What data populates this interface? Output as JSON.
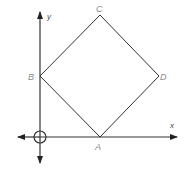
{
  "diagram": {
    "type": "coordinate-geometry",
    "axes": {
      "x_label": "x",
      "y_label": "y",
      "origin_marker": "circle-crosshair"
    },
    "shape": "square",
    "vertices": [
      {
        "name": "A",
        "label": "A",
        "position": "on x-axis"
      },
      {
        "name": "B",
        "label": "B",
        "position": "on y-axis"
      },
      {
        "name": "C",
        "label": "C",
        "position": "top"
      },
      {
        "name": "D",
        "label": "D",
        "position": "right"
      }
    ],
    "colors": {
      "line": "#333333",
      "label": "#8a8a8a",
      "background": "#ffffff"
    }
  }
}
